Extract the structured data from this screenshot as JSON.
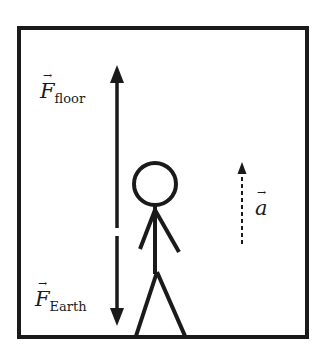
{
  "diagram": {
    "type": "free-body diagram",
    "colors": {
      "stroke": "#1a1a1a",
      "background": "#ffffff"
    },
    "labels": {
      "force_floor": {
        "symbol": "F",
        "subscript": "floor",
        "vector_arrow": "→"
      },
      "force_earth": {
        "symbol": "F",
        "subscript": "Earth",
        "vector_arrow": "→"
      },
      "acceleration": {
        "symbol": "a",
        "vector_arrow": "→"
      }
    },
    "arrows": [
      {
        "name": "F_floor",
        "direction": "up",
        "style": "solid"
      },
      {
        "name": "F_Earth",
        "direction": "down",
        "style": "solid"
      },
      {
        "name": "a",
        "direction": "up",
        "style": "dashed"
      }
    ]
  }
}
